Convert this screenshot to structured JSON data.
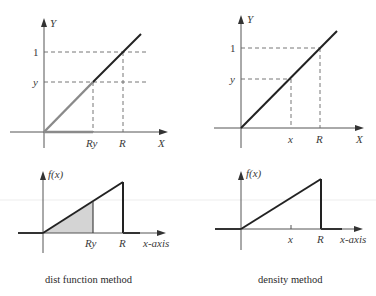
{
  "panels": {
    "top_left": {
      "y_axis_label": "Y",
      "x_axis_label": "X",
      "y_ticks": [
        "1",
        "y"
      ],
      "x_ticks": [
        "Ry",
        "R"
      ]
    },
    "top_right": {
      "y_axis_label": "Y",
      "x_axis_label": "X",
      "y_ticks": [
        "1",
        "y"
      ],
      "x_ticks": [
        "x",
        "R"
      ]
    },
    "bottom_left": {
      "y_axis_label": "f(x)",
      "x_axis_label": "x-axis",
      "x_ticks": [
        "Ry",
        "R"
      ]
    },
    "bottom_right": {
      "y_axis_label": "f(x)",
      "x_axis_label": "x-axis",
      "x_ticks": [
        "x",
        "R"
      ]
    }
  },
  "captions": {
    "left": "dist function method",
    "right": "density method"
  },
  "colors": {
    "line": "#222222",
    "highlight": "#8a8a8a",
    "shade": "#d4d4d4",
    "dash": "#666666"
  }
}
